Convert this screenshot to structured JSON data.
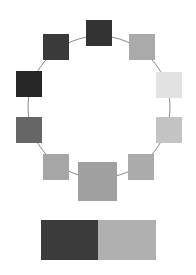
{
  "ring": {
    "cx": 99,
    "cy": 107,
    "r": 71,
    "stroke": "#8a8a8a"
  },
  "swatches": [
    {
      "id": "top",
      "x": 86,
      "y": 20,
      "size": 26,
      "color": "#333333"
    },
    {
      "id": "upper-right",
      "x": 129,
      "y": 34,
      "size": 26,
      "color": "#aaaaaa"
    },
    {
      "id": "right",
      "x": 156,
      "y": 72,
      "size": 26,
      "color": "#e2e2e2"
    },
    {
      "id": "lower-right",
      "x": 156,
      "y": 117,
      "size": 26,
      "color": "#c4c4c4"
    },
    {
      "id": "bottom-right",
      "x": 128,
      "y": 154,
      "size": 26,
      "color": "#ababab"
    },
    {
      "id": "bottom-center",
      "x": 78,
      "y": 162,
      "size": 39,
      "color": "#a0a0a0"
    },
    {
      "id": "bottom-left",
      "x": 43,
      "y": 154,
      "size": 26,
      "color": "#a6a6a6"
    },
    {
      "id": "lower-left",
      "x": 16,
      "y": 117,
      "size": 26,
      "color": "#666666"
    },
    {
      "id": "left",
      "x": 16,
      "y": 71,
      "size": 26,
      "color": "#262626"
    },
    {
      "id": "upper-left",
      "x": 43,
      "y": 34,
      "size": 26,
      "color": "#3a3a3a"
    }
  ],
  "comparison_bar": {
    "x": 41,
    "y": 220,
    "width": 115,
    "height": 40,
    "left_color": "#3b3b3b",
    "right_color": "#b0b0b0",
    "left_width": 57
  }
}
